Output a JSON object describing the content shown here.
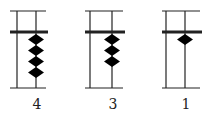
{
  "diagram": {
    "type": "abacus-rods",
    "rods": [
      {
        "label": "4",
        "beads": 4
      },
      {
        "label": "3",
        "beads": 3
      },
      {
        "label": "1",
        "beads": 1
      }
    ],
    "colors": {
      "line": "#222222",
      "bead": "#000000",
      "background": "#ffffff"
    }
  }
}
